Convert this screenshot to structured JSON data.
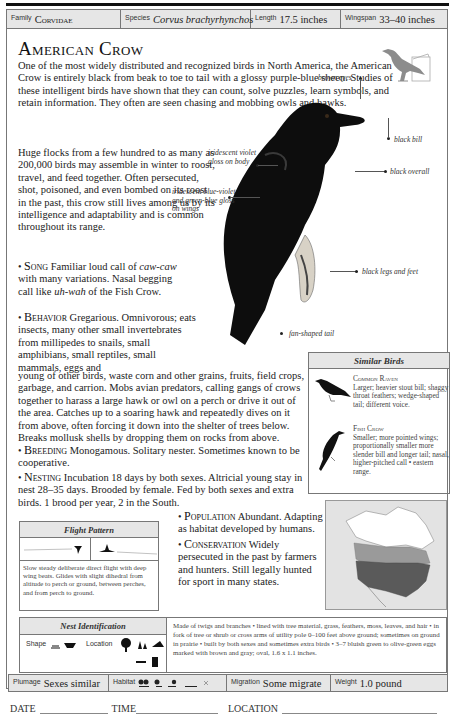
{
  "header": {
    "family_label": "Family",
    "family_value": "Corvidae",
    "species_label": "Species",
    "species_value": "Corvus brachyrhynchos",
    "length_label": "Length",
    "length_value": "17.5 inches",
    "wingspan_label": "Wingspan",
    "wingspan_value": "33–40 inches"
  },
  "title": "American Crow",
  "intro": "One of the most widely distributed and recognized birds in North America, the American Crow is entirely black from beak to toe to tail with a glossy purple-blue sheen. Studies of these intelligent birds have shown that they can count, solve puzzles, learn symbols, and retain information. They often are seen chasing and mobbing owls and hawks.",
  "intro_narrow": "Huge flocks from a few hundred to as many as 200,000 birds may assemble in winter to roost, travel, and feed together. Often persecuted, shot, poisoned, and even bombed on its roost in the past, this crow still lives among us by its intelligence and adaptability and is common throughout its range.",
  "sections": {
    "song": {
      "heading": "Song",
      "text_a": "Familiar loud call of",
      "call1": "caw-caw",
      "text_b": "with many variations. Nasal begging call like",
      "call2": "uh-wah",
      "text_c": "of the Fish Crow."
    },
    "behavior": {
      "heading": "Behavior",
      "text_narrow": "Gregarious. Omnivorous; eats insects, many other small invertebrates from millipedes to snails, small amphibians, small reptiles, small mammals, eggs and",
      "text_wide": "young of other birds, waste corn and other grains, fruits, field crops, garbage, and carrion. Mobs avian predators, calling gangs of crows together to harass a large hawk or owl on a perch or drive it out of the area. Catches up to a soaring hawk and repeatedly dives on it from above, often forcing it down into the shelter of trees below. Breaks mollusk shells by dropping them on rocks from above."
    },
    "breeding": {
      "heading": "Breeding",
      "text": "Monogamous. Solitary nester. Sometimes known to be cooperative."
    },
    "nesting": {
      "heading": "Nesting",
      "text": "Incubation 18 days by both sexes. Altricial young stay in nest 28–35 days. Brooded by female. Fed by both sexes and extra birds. 1 brood per year, 2 in the South."
    },
    "population": {
      "heading": "Population",
      "text": "Abundant. Adapting as habitat developed by humans."
    },
    "conservation": {
      "heading": "Conservation",
      "text": "Widely persecuted in the past by farmers and hunters. Still legally hunted for sport in many states."
    }
  },
  "annotations": {
    "eyes": "brown eyes",
    "bill": "black bill",
    "overall": "black overall",
    "body_gloss": "iridescent violet gloss on body",
    "wing_gloss": "iridescent blue-violet and green-blue gloss on wings",
    "legs": "black legs and feet",
    "tail": "fan-shaped tail"
  },
  "similar_birds": {
    "heading": "Similar Birds",
    "items": [
      {
        "name": "Common Raven",
        "desc": "Larger; heavier stout bill; shaggy throat feathers; wedge-shaped tail; different voice."
      },
      {
        "name": "Fish Crow",
        "desc": "Smaller; more pointed wings; proportionally smaller more slender bill and longer tail; nasal, higher-pitched call • eastern range."
      }
    ]
  },
  "flight_pattern": {
    "heading": "Flight Pattern",
    "desc": "Slow steady deliberate direct flight with deep wing beats. Glides with slight dihedral from altitude to perch or ground, between perches, and from perch to ground."
  },
  "nest_identification": {
    "heading": "Nest Identification",
    "shape_label": "Shape",
    "location_label": "Location",
    "desc": "Made of twigs and branches • lined with tree material, grass, feathers, moss, leaves, and hair • in fork of tree or shrub or cross arms of utility pole 0–100 feet above ground; sometimes on ground in prairie • built by both sexes and sometimes extra birds • 3–7 bluish green to olive-green eggs marked with brown and gray; oval, 1.6 x 1.1 inches."
  },
  "footer": {
    "plumage_label": "Plumage",
    "plumage_value": "Sexes similar",
    "habitat_label": "Habitat",
    "migration_label": "Migration",
    "migration_value": "Some migrate",
    "weight_label": "Weight",
    "weight_value": "1.0 pound"
  },
  "log": {
    "date": "DATE",
    "time": "TIME",
    "location": "LOCATION"
  },
  "colors": {
    "header_bg": "#e6e6e6",
    "map_range_dark": "#5a5a5a",
    "map_range_light": "#9a9a9a",
    "silhouette": "#8c8c8c"
  }
}
